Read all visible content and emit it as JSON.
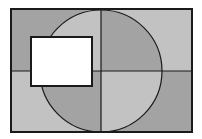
{
  "diagram": {
    "type": "geometric-figure",
    "colors": {
      "dark": "#a3a3a3",
      "light": "#c2c2c2",
      "stroke": "#1a1a1a",
      "white_rect": "#ffffff",
      "background": "#ffffff"
    },
    "outer_rect": {
      "x": 11,
      "y": 9,
      "width": 181,
      "height": 123
    },
    "center": {
      "x": 101,
      "y": 71
    },
    "circle": {
      "cx": 101,
      "cy": 71,
      "r": 61
    },
    "white_rect": {
      "x": 31,
      "y": 37,
      "width": 61,
      "height": 49
    },
    "quadrant_shading_outside": {
      "top_left": "dark",
      "top_right": "light",
      "bottom_left": "light",
      "bottom_right": "dark"
    },
    "quadrant_shading_inside_circle": {
      "top_left": "light",
      "top_right": "dark",
      "bottom_left": "dark",
      "bottom_right": "light"
    }
  }
}
